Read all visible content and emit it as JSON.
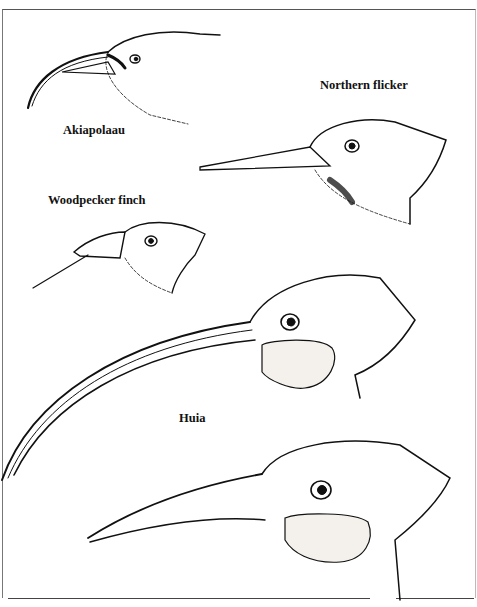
{
  "figure": {
    "labels": {
      "akiapolaau": "Akiapolaau",
      "northern_flicker": "Northern flicker",
      "woodpecker_finch": "Woodpecker finch",
      "huia": "Huia"
    },
    "colors": {
      "ink": "#111111",
      "paper": "#ffffff",
      "rule": "#555555"
    }
  }
}
